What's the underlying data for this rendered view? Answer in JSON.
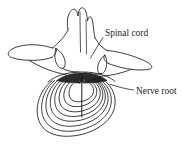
{
  "figure": {
    "name": "vertebra-axial-view",
    "background_color": "#ffffff",
    "line_color": "#1a1a1a",
    "shading_color": "#2a2a2a"
  },
  "labels": [
    {
      "id": "spinal-cord",
      "text": "Spinal cord",
      "x": 105,
      "y": 35,
      "leader_from_x": 103,
      "leader_from_y": 37,
      "leader_to_x": 92,
      "leader_to_y": 57
    },
    {
      "id": "nerve-root",
      "text": "Nerve root",
      "x": 136,
      "y": 93,
      "leader_from_x": 133,
      "leader_from_y": 90,
      "leader_to_x": 108,
      "leader_to_y": 84
    }
  ],
  "structures": {
    "spinous_process": "spinous-process",
    "transverse_process_left": "transverse-process-left",
    "transverse_process_right": "transverse-process-right",
    "lamina": "lamina",
    "articular_facet_left": "articular-facet-left",
    "articular_facet_right": "articular-facet-right",
    "vertebral_canal": "vertebral-canal",
    "annulus_fibrosus": "annulus-fibrosus-rings",
    "nucleus_pulposus": "nucleus-pulposus",
    "herniation_arrow": "herniation-arrow"
  },
  "annulus_ring_count": 7
}
